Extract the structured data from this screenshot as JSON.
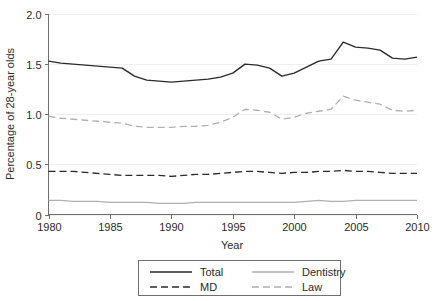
{
  "chart_data": {
    "type": "line",
    "title": "",
    "xlabel": "Year",
    "ylabel": "Percentage of 28-year olds",
    "xlim": [
      1980,
      2010
    ],
    "ylim": [
      0,
      2.0
    ],
    "xticks": [
      "1980",
      "1985",
      "1990",
      "1995",
      "2000",
      "2005",
      "2010"
    ],
    "xtick_values": [
      1980,
      1985,
      1990,
      1995,
      2000,
      2005,
      2010
    ],
    "yticks": [
      "0",
      "0.5",
      "1.0",
      "1.5",
      "2.0"
    ],
    "ytick_values": [
      0,
      0.5,
      1.0,
      1.5,
      2.0
    ],
    "grid": "faint-horizontal",
    "legend_position": "below-plot",
    "x": [
      1980,
      1981,
      1982,
      1983,
      1984,
      1985,
      1986,
      1987,
      1988,
      1989,
      1990,
      1991,
      1992,
      1993,
      1994,
      1995,
      1996,
      1997,
      1998,
      1999,
      2000,
      2001,
      2002,
      2003,
      2004,
      2005,
      2006,
      2007,
      2008,
      2009,
      2010
    ],
    "series": [
      {
        "name": "Total",
        "color": "#2b2b2b",
        "dash": "solid",
        "width": 1.4,
        "values": [
          1.53,
          1.51,
          1.5,
          1.49,
          1.48,
          1.47,
          1.46,
          1.38,
          1.34,
          1.33,
          1.32,
          1.33,
          1.34,
          1.35,
          1.37,
          1.41,
          1.5,
          1.49,
          1.46,
          1.38,
          1.41,
          1.47,
          1.53,
          1.55,
          1.72,
          1.67,
          1.66,
          1.64,
          1.56,
          1.55,
          1.57
        ]
      },
      {
        "name": "MD",
        "color": "#2b2b2b",
        "dash": "dashed",
        "width": 1.4,
        "values": [
          0.43,
          0.43,
          0.43,
          0.42,
          0.41,
          0.4,
          0.39,
          0.39,
          0.39,
          0.39,
          0.38,
          0.39,
          0.4,
          0.4,
          0.41,
          0.42,
          0.43,
          0.43,
          0.42,
          0.41,
          0.42,
          0.42,
          0.43,
          0.43,
          0.44,
          0.43,
          0.43,
          0.42,
          0.41,
          0.41,
          0.41
        ]
      },
      {
        "name": "Dentistry",
        "color": "#b0b0b0",
        "dash": "solid",
        "width": 1.3,
        "values": [
          0.14,
          0.14,
          0.13,
          0.13,
          0.13,
          0.12,
          0.12,
          0.12,
          0.12,
          0.11,
          0.11,
          0.11,
          0.12,
          0.12,
          0.12,
          0.12,
          0.12,
          0.12,
          0.12,
          0.12,
          0.12,
          0.13,
          0.14,
          0.13,
          0.13,
          0.14,
          0.14,
          0.14,
          0.14,
          0.14,
          0.14
        ]
      },
      {
        "name": "Law",
        "color": "#b0b0b0",
        "dash": "dashed",
        "width": 1.3,
        "values": [
          0.98,
          0.96,
          0.95,
          0.94,
          0.93,
          0.92,
          0.91,
          0.88,
          0.87,
          0.87,
          0.87,
          0.88,
          0.88,
          0.89,
          0.92,
          0.97,
          1.05,
          1.04,
          1.02,
          0.95,
          0.97,
          1.01,
          1.03,
          1.05,
          1.18,
          1.14,
          1.12,
          1.1,
          1.04,
          1.03,
          1.04
        ]
      }
    ],
    "legend_entries": [
      {
        "label": "Total",
        "color": "#2b2b2b",
        "dash": "solid"
      },
      {
        "label": "Dentistry",
        "color": "#b0b0b0",
        "dash": "solid"
      },
      {
        "label": "MD",
        "color": "#2b2b2b",
        "dash": "dashed"
      },
      {
        "label": "Law",
        "color": "#b0b0b0",
        "dash": "dashed"
      }
    ]
  }
}
